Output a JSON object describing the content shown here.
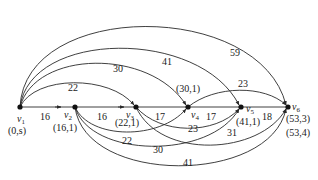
{
  "diagram": {
    "type": "weighted-directed-graph",
    "nodes": [
      {
        "id": "v1",
        "name": "v",
        "sub": "1",
        "label": "(0,s)",
        "x": 20,
        "y": 107
      },
      {
        "id": "v2",
        "name": "v",
        "sub": "2",
        "label": "(16,1)",
        "x": 75,
        "y": 107
      },
      {
        "id": "v3",
        "name": "v",
        "sub": "3",
        "label": "(22,1)",
        "x": 136,
        "y": 107
      },
      {
        "id": "v4",
        "name": "v",
        "sub": "4",
        "label": "(30,1)",
        "x": 188,
        "y": 107
      },
      {
        "id": "v5",
        "name": "v",
        "sub": "5",
        "label": "(41,1)",
        "x": 241,
        "y": 107
      },
      {
        "id": "v6",
        "name": "v",
        "sub": "6",
        "label": "(53,3)",
        "label2": "(53,4)",
        "x": 288,
        "y": 107
      }
    ],
    "edges": [
      {
        "from": "v1",
        "to": "v2",
        "weight": "16"
      },
      {
        "from": "v2",
        "to": "v3",
        "weight": "16"
      },
      {
        "from": "v3",
        "to": "v4",
        "weight": "17"
      },
      {
        "from": "v4",
        "to": "v5",
        "weight": "17"
      },
      {
        "from": "v5",
        "to": "v6",
        "weight": "18"
      },
      {
        "from": "v1",
        "to": "v3",
        "weight": "22"
      },
      {
        "from": "v1",
        "to": "v4",
        "weight": "30"
      },
      {
        "from": "v1",
        "to": "v5",
        "weight": "41"
      },
      {
        "from": "v1",
        "to": "v6",
        "weight": "59"
      },
      {
        "from": "v4",
        "to": "v6",
        "weight": "23"
      },
      {
        "from": "v2",
        "to": "v4",
        "weight": "22"
      },
      {
        "from": "v2",
        "to": "v5",
        "weight": "30"
      },
      {
        "from": "v2",
        "to": "v6",
        "weight": "41"
      },
      {
        "from": "v3",
        "to": "v5",
        "weight": "23"
      },
      {
        "from": "v3",
        "to": "v6",
        "weight": "31"
      }
    ]
  }
}
